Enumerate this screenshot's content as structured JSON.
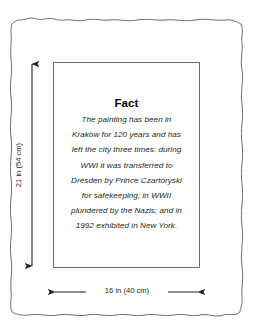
{
  "diagram": {
    "type": "framed-painting-dimension-diagram",
    "frame": {
      "style": "hand-drawn wavy outline",
      "stroke_color": "#6d6e71"
    },
    "canvas": {
      "stroke_color": "#6d6e71",
      "fill_color": "#ffffff"
    },
    "fact_card": {
      "title": "Fact",
      "lines": [
        "The painting has been in",
        "Kraków for 120 years and has",
        "left the city three times: during",
        "WWI it was transferred to",
        "Dresden by Prince Czartoryski",
        "for safekeeping; in WWII",
        "plundered by the Nazis; and in",
        "1992 exhibited in New York."
      ],
      "full_text": "The painting has been in Kraków for 120 years and has left the city three times: during WWI it was transferred to Dresden by Prince Czartoryski for safekeeping; in WWII plundered by the Nazis; and in 1992 exhibited in New York."
    },
    "dimensions": {
      "height": {
        "label": "21 in (54 cm)",
        "orientation": "vertical",
        "arrow": "double-headed"
      },
      "width": {
        "label": "16 in (40 cm)",
        "orientation": "horizontal",
        "arrow": "double-headed"
      }
    }
  }
}
